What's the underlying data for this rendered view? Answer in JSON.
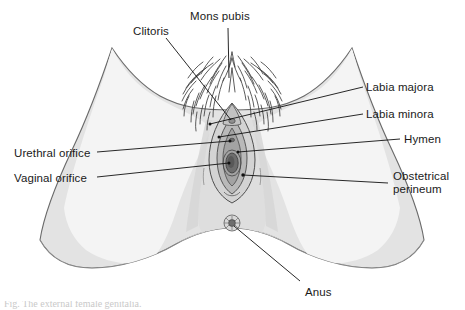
{
  "figure": {
    "colors": {
      "outline": "#555555",
      "skin_outer": "#e6e6e6",
      "skin_inner": "#f2f2f2",
      "perineum": "#dcdcdc",
      "labia_majora_fill": "#cfcfcf",
      "labia_minora_fill": "#b4b4b4",
      "vestibule": "#9a9a9a",
      "vaginal_orifice": "#6f6f6f",
      "hair": "#4a4a4a",
      "leader_line": "#111111",
      "label_text": "#1a1a1a",
      "background": "#ffffff"
    },
    "labels": [
      {
        "id": "mons-pubis",
        "text": "Mons pubis",
        "x": 190,
        "y": 10
      },
      {
        "id": "clitoris",
        "text": "Clitoris",
        "x": 133,
        "y": 25
      },
      {
        "id": "labia-majora",
        "text": "Labia majora",
        "x": 366,
        "y": 81
      },
      {
        "id": "labia-minora",
        "text": "Labia minora",
        "x": 366,
        "y": 108
      },
      {
        "id": "hymen",
        "text": "Hymen",
        "x": 404,
        "y": 133
      },
      {
        "id": "urethral-orifice",
        "text": "Urethral orifice",
        "x": 14,
        "y": 147
      },
      {
        "id": "vaginal-orifice",
        "text": "Vaginal orifice",
        "x": 14,
        "y": 172
      },
      {
        "id": "obstetrical-perineum",
        "text": "Obstetrical perineum",
        "x": 393,
        "y": 170
      },
      {
        "id": "anus",
        "text": "Anus",
        "x": 305,
        "y": 286
      }
    ],
    "caption": "Fig. The external female genitalia."
  }
}
